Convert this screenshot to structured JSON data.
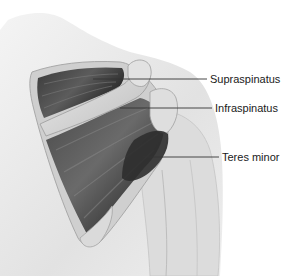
{
  "figure": {
    "labels": [
      {
        "text": "Supraspinatus",
        "x": 210,
        "y": 73,
        "line": [
          93,
          79,
          207,
          79
        ]
      },
      {
        "text": "Infraspinatus",
        "x": 215,
        "y": 102,
        "line": [
          120,
          108,
          212,
          108
        ]
      },
      {
        "text": "Teres minor",
        "x": 222,
        "y": 151,
        "line": [
          143,
          157,
          219,
          157
        ]
      }
    ]
  },
  "colors": {
    "background": "#ffffff",
    "skin": "#e6e6e6",
    "muscle_dark": "#2a2a2a",
    "bone": "#d8d8d8",
    "leader_line": "#333333"
  }
}
